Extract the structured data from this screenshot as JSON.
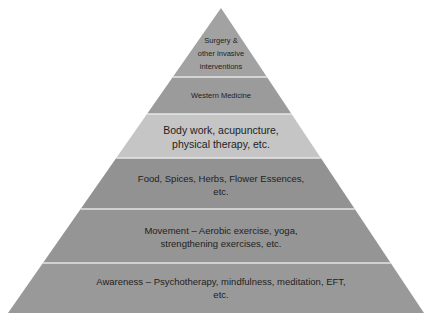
{
  "diagram": {
    "type": "pyramid",
    "apex": [
      221,
      8
    ],
    "base_y": 313,
    "base_left_x": 8,
    "base_right_x": 424,
    "divider_color": "#e6e6e6",
    "tiers": [
      {
        "level": 1,
        "position": "top",
        "lines": [
          "Surgery &",
          "other invasive",
          "interventions"
        ],
        "fill": "#a2a2a2",
        "y_top": 8,
        "y_bottom": 77
      },
      {
        "level": 2,
        "lines": [
          "Western Medicine"
        ],
        "fill": "#9b9b9b",
        "y_top": 77,
        "y_bottom": 114
      },
      {
        "level": 3,
        "lines": [
          "Body work, acupuncture,",
          "physical therapy, etc."
        ],
        "fill": "#c5c5c5",
        "y_top": 114,
        "y_bottom": 158
      },
      {
        "level": 4,
        "lines": [
          "Food, Spices, Herbs, Flower Essences,",
          "etc."
        ],
        "fill": "#929292",
        "y_top": 158,
        "y_bottom": 209
      },
      {
        "level": 5,
        "lines": [
          "Movement – Aerobic exercise, yoga,",
          "strengthening exercises, etc."
        ],
        "fill": "#959595",
        "y_top": 209,
        "y_bottom": 263
      },
      {
        "level": 6,
        "position": "base",
        "lines": [
          "Awareness – Psychotherapy, mindfulness, meditation, EFT,",
          "etc."
        ],
        "fill": "#999999",
        "y_top": 263,
        "y_bottom": 313
      }
    ]
  }
}
